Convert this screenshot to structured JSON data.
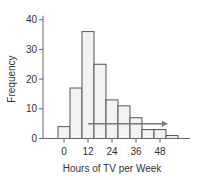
{
  "chart_data": {
    "type": "bar",
    "title": "",
    "xlabel": "Hours of TV per Week",
    "ylabel": "Frequency",
    "bin_centers": [
      0,
      6,
      12,
      18,
      24,
      30,
      36,
      42,
      48,
      54
    ],
    "bin_width": 6,
    "values": [
      4,
      17,
      36,
      25,
      13,
      11,
      7,
      3,
      3,
      1
    ],
    "xticks": [
      0,
      12,
      24,
      36,
      48
    ],
    "xtick_labels": [
      "0",
      "12",
      "24",
      "36",
      "48"
    ],
    "yticks": [
      0,
      10,
      20,
      30,
      40
    ],
    "ytick_labels": [
      "0",
      "10",
      "20",
      "30",
      "40"
    ],
    "ylim": [
      0,
      40
    ],
    "grid": false,
    "legend": null,
    "annotations": [
      {
        "type": "arrow",
        "from_x": 12,
        "to_x": 52,
        "y": 5,
        "direction": "right",
        "meaning": "right skew"
      }
    ],
    "colors": {
      "bar_fill": "#f2f2f2",
      "bar_edge": "#555555",
      "axis": "#666666",
      "arrow": "#777777"
    }
  }
}
